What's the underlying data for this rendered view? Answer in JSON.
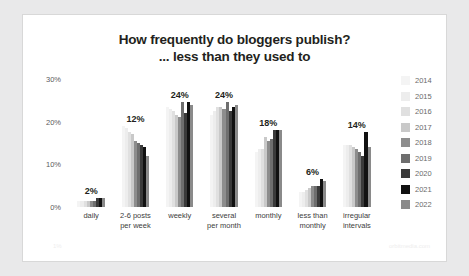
{
  "title": {
    "line1": "How frequently do bloggers publish?",
    "line2": "... less than they used to"
  },
  "watermarks": {
    "left": "1%",
    "right": "orbitmedia.com"
  },
  "legend": {
    "position": "right",
    "entries": [
      {
        "label": "2014",
        "color": "#f4f4f4"
      },
      {
        "label": "2015",
        "color": "#ededed"
      },
      {
        "label": "2016",
        "color": "#e0e0e0"
      },
      {
        "label": "2017",
        "color": "#c9c9c9"
      },
      {
        "label": "2018",
        "color": "#8d8d8d"
      },
      {
        "label": "2019",
        "color": "#6e6e6e"
      },
      {
        "label": "2020",
        "color": "#3a3a3a"
      },
      {
        "label": "2021",
        "color": "#111111"
      },
      {
        "label": "2022",
        "color": "#8a8a8a"
      }
    ]
  },
  "chart_data": {
    "type": "bar",
    "title": "How frequently do bloggers publish? ... less than they used to",
    "xlabel": "",
    "ylabel": "",
    "ylim": [
      0,
      30
    ],
    "grid": false,
    "yticks": [
      "0%",
      "10%",
      "20%",
      "30%"
    ],
    "ytick_values": [
      0,
      10,
      20,
      30
    ],
    "categories": [
      "daily",
      "2-6 posts per week",
      "weekly",
      "several per month",
      "monthly",
      "less than monthly",
      "irregular intervals"
    ],
    "category_lines": [
      [
        "daily"
      ],
      [
        "2-6 posts",
        "per week"
      ],
      [
        "weekly"
      ],
      [
        "several",
        "per month"
      ],
      [
        "monthly"
      ],
      [
        "less than",
        "monthly"
      ],
      [
        "irregular",
        "intervals"
      ]
    ],
    "series": [
      {
        "name": "2014",
        "color": "#f4f4f4",
        "values": [
          1.5,
          19.0,
          23.5,
          21.5,
          13.0,
          3.5,
          14.5
        ]
      },
      {
        "name": "2015",
        "color": "#ededed",
        "values": [
          1.5,
          18.5,
          23.0,
          22.5,
          13.5,
          3.5,
          14.5
        ]
      },
      {
        "name": "2016",
        "color": "#e0e0e0",
        "values": [
          1.5,
          17.5,
          22.5,
          23.5,
          13.5,
          4.0,
          14.5
        ]
      },
      {
        "name": "2017",
        "color": "#c9c9c9",
        "values": [
          1.5,
          17.0,
          21.5,
          23.5,
          16.5,
          4.5,
          14.0
        ]
      },
      {
        "name": "2018",
        "color": "#8d8d8d",
        "values": [
          1.5,
          15.5,
          21.0,
          23.0,
          15.5,
          5.0,
          13.5
        ]
      },
      {
        "name": "2019",
        "color": "#6e6e6e",
        "values": [
          1.5,
          15.0,
          24.5,
          24.5,
          16.0,
          5.0,
          13.0
        ]
      },
      {
        "name": "2020",
        "color": "#3a3a3a",
        "values": [
          2.0,
          14.5,
          22.0,
          22.5,
          18.0,
          5.0,
          12.0
        ]
      },
      {
        "name": "2021",
        "color": "#111111",
        "values": [
          2.0,
          14.0,
          24.5,
          23.5,
          18.0,
          6.5,
          17.5
        ]
      },
      {
        "name": "2022",
        "color": "#8a8a8a",
        "values": [
          2.0,
          12.0,
          24.0,
          24.0,
          18.0,
          6.0,
          14.0
        ]
      }
    ],
    "data_labels": [
      "2%",
      "12%",
      "24%",
      "24%",
      "18%",
      "6%",
      "14%"
    ],
    "data_label_series": "2022"
  }
}
